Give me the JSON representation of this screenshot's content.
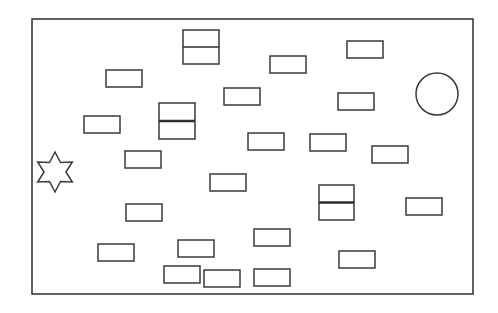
{
  "diagram": {
    "colors": {
      "stroke": "#3a3a3a",
      "background": "#ffffff"
    },
    "frame": {
      "x": 32,
      "y": 19,
      "w": 441,
      "h": 275
    },
    "single_rects": [
      {
        "x": 106,
        "y": 70,
        "w": 36,
        "h": 17
      },
      {
        "x": 270,
        "y": 56,
        "w": 36,
        "h": 17
      },
      {
        "x": 347,
        "y": 41,
        "w": 36,
        "h": 17
      },
      {
        "x": 224,
        "y": 88,
        "w": 36,
        "h": 17
      },
      {
        "x": 338,
        "y": 93,
        "w": 36,
        "h": 17
      },
      {
        "x": 84,
        "y": 116,
        "w": 36,
        "h": 17
      },
      {
        "x": 125,
        "y": 151,
        "w": 36,
        "h": 17
      },
      {
        "x": 248,
        "y": 133,
        "w": 36,
        "h": 17
      },
      {
        "x": 310,
        "y": 134,
        "w": 36,
        "h": 17
      },
      {
        "x": 372,
        "y": 146,
        "w": 36,
        "h": 17
      },
      {
        "x": 210,
        "y": 174,
        "w": 36,
        "h": 17
      },
      {
        "x": 126,
        "y": 204,
        "w": 36,
        "h": 17
      },
      {
        "x": 406,
        "y": 198,
        "w": 36,
        "h": 17
      },
      {
        "x": 98,
        "y": 244,
        "w": 36,
        "h": 17
      },
      {
        "x": 178,
        "y": 240,
        "w": 36,
        "h": 17
      },
      {
        "x": 254,
        "y": 229,
        "w": 36,
        "h": 17
      },
      {
        "x": 339,
        "y": 251,
        "w": 36,
        "h": 17
      },
      {
        "x": 164,
        "y": 266,
        "w": 36,
        "h": 17
      },
      {
        "x": 204,
        "y": 270,
        "w": 36,
        "h": 17
      },
      {
        "x": 254,
        "y": 269,
        "w": 36,
        "h": 17
      }
    ],
    "stacked_rects": [
      {
        "x": 183,
        "y": 30,
        "w": 36,
        "h": 34,
        "divider": "thin"
      },
      {
        "x": 159,
        "y": 103,
        "w": 36,
        "h": 36,
        "divider": "thick"
      },
      {
        "x": 319,
        "y": 185,
        "w": 35,
        "h": 35,
        "divider": "thick"
      }
    ],
    "circle": {
      "cx": 437,
      "cy": 94,
      "r": 21
    },
    "star": {
      "cx": 55,
      "cy": 172,
      "r_outer": 20,
      "r_inner": 11,
      "points": 6
    }
  }
}
